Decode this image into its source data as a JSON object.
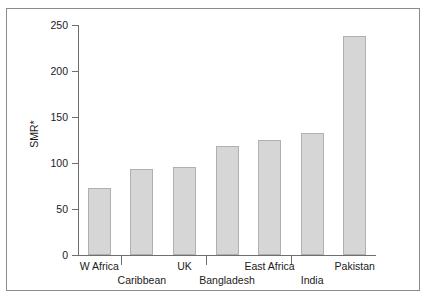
{
  "chart_data": {
    "type": "bar",
    "title": "",
    "xlabel": "",
    "ylabel": "SMR*",
    "ylim": [
      0,
      250
    ],
    "yticks": [
      0,
      50,
      100,
      150,
      200,
      250
    ],
    "grid": false,
    "legend": null,
    "bar_color": "#d6d6d6",
    "bar_edge_color": "#b0b0b0",
    "categories": [
      "W Africa",
      "Caribbean",
      "UK",
      "Bangladesh",
      "East Africa",
      "India",
      "Pakistan"
    ],
    "values": [
      73,
      93,
      96,
      118,
      125,
      133,
      238
    ],
    "label_rows": [
      0,
      1,
      0,
      1,
      0,
      1,
      0
    ]
  },
  "axis": {
    "y_label": "SMR*",
    "y_tick_labels": [
      "250",
      "200",
      "150",
      "100",
      "50",
      "0"
    ]
  }
}
